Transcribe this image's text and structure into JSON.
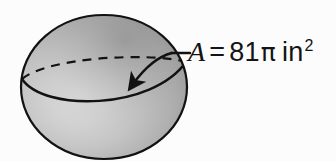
{
  "figure": {
    "kind": "sphere-surface-area-diagram",
    "background_color": "#fcfcfc",
    "label": {
      "full_text": "A = 81π in²",
      "variable": "A",
      "equals": "=",
      "coefficient": "81",
      "pi_symbol": "π",
      "unit": "in",
      "unit_exponent": "2"
    },
    "sphere": {
      "center_x": 104,
      "center_y": 87,
      "radius_x": 83,
      "radius_y": 72,
      "outline_color": "#121212",
      "outline_width": 2.2,
      "fill_light": "#dcdcdc",
      "fill_mid": "#bdbdbd",
      "fill_dark": "#8a8a8a",
      "fill_edge": "#7c7c7c",
      "highlight_x": 72,
      "highlight_y": 95
    },
    "equator": {
      "back_arc_style": "dashed",
      "front_arc_style": "solid",
      "dash_pattern": "9 7",
      "stroke_color": "#121212",
      "stroke_width": 2.2
    },
    "leader": {
      "line_color": "#121212",
      "line_width": 2.4,
      "segment_x1": 171,
      "segment_y1": 53,
      "segment_x2": 189,
      "segment_y2": 53,
      "arrow_tip_x": 128,
      "arrow_tip_y": 88,
      "arrow_label": "points to sphere surface"
    }
  }
}
